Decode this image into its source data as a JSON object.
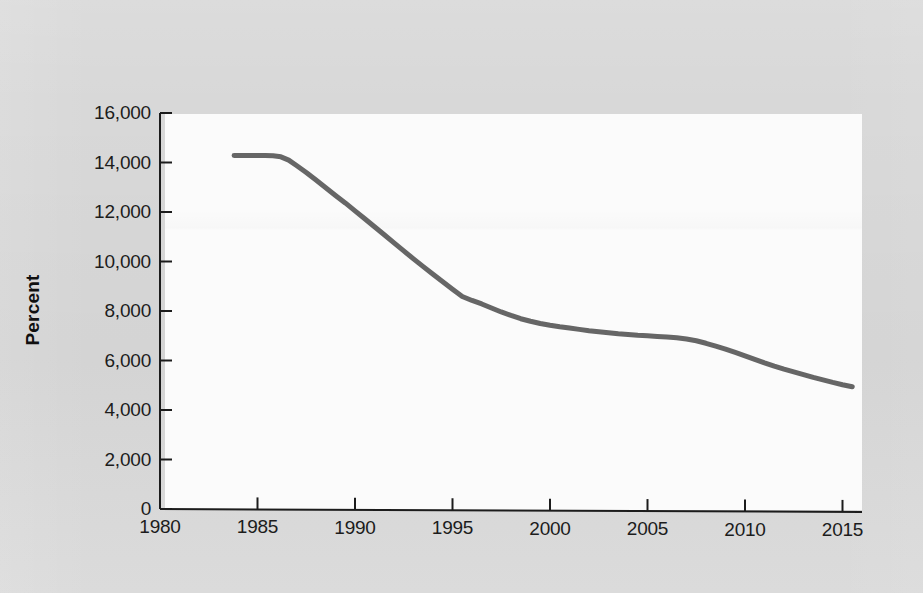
{
  "figure": {
    "background_color": "#d8d8d8",
    "panel_color": "#fbfbfb",
    "axis_color": "#1c1c1c",
    "series_color": "#666666"
  },
  "chart_data": {
    "type": "line",
    "title": "",
    "subtitle": "",
    "xlabel": "",
    "ylabel": "Percent",
    "xlim": [
      1980,
      2016
    ],
    "ylim": [
      0,
      16000
    ],
    "grid": false,
    "legend": null,
    "x_tick_labels": [
      "1980",
      "1985",
      "1990",
      "1995",
      "2000",
      "2005",
      "2010",
      "2015"
    ],
    "x_ticks": [
      1980,
      1985,
      1990,
      1995,
      2000,
      2005,
      2010,
      2015
    ],
    "y_tick_labels": [
      "0",
      "2,000",
      "4,000",
      "6,000",
      "8,000",
      "10,000",
      "12,000",
      "14,000",
      "16,000"
    ],
    "y_ticks": [
      0,
      2000,
      4000,
      6000,
      8000,
      10000,
      12000,
      14000,
      16000
    ],
    "series": [
      {
        "name": "Percent",
        "color": "#666666",
        "x": [
          1983.8,
          1984.2,
          1984.6,
          1985.0,
          1985.4,
          1985.8,
          1986.2,
          1986.6,
          1987.0,
          1987.5,
          1988.0,
          1988.5,
          1989.0,
          1989.5,
          1990.0,
          1990.5,
          1991.0,
          1991.5,
          1992.0,
          1992.5,
          1993.0,
          1993.5,
          1994.0,
          1994.5,
          1995.0,
          1995.5,
          1996.0,
          1996.5,
          1997.0,
          1997.5,
          1998.0,
          1998.5,
          1999.0,
          1999.5,
          2000.0,
          2000.5,
          2001.0,
          2001.5,
          2002.0,
          2002.5,
          2003.0,
          2003.5,
          2004.0,
          2004.5,
          2005.0,
          2005.5,
          2006.0,
          2006.5,
          2007.0,
          2007.5,
          2008.0,
          2008.5,
          2009.0,
          2009.5,
          2010.0,
          2010.5,
          2011.0,
          2011.5,
          2012.0,
          2012.5,
          2013.0,
          2013.5,
          2014.0,
          2014.5,
          2015.0,
          2015.5
        ],
        "y": [
          14300,
          14300,
          14300,
          14300,
          14300,
          14290,
          14250,
          14120,
          13900,
          13620,
          13320,
          13010,
          12700,
          12400,
          12080,
          11760,
          11440,
          11120,
          10790,
          10470,
          10150,
          9840,
          9530,
          9230,
          8930,
          8640,
          8480,
          8340,
          8180,
          8020,
          7880,
          7750,
          7650,
          7560,
          7490,
          7430,
          7380,
          7330,
          7280,
          7240,
          7200,
          7160,
          7130,
          7100,
          7080,
          7060,
          7040,
          7010,
          6960,
          6890,
          6790,
          6680,
          6560,
          6430,
          6290,
          6150,
          6010,
          5880,
          5760,
          5650,
          5540,
          5430,
          5330,
          5230,
          5140,
          5060
        ]
      }
    ]
  },
  "axis_geometry": {
    "panel_left_px": 165,
    "panel_top_px": 114,
    "panel_width_px": 697,
    "panel_height_px": 396
  }
}
